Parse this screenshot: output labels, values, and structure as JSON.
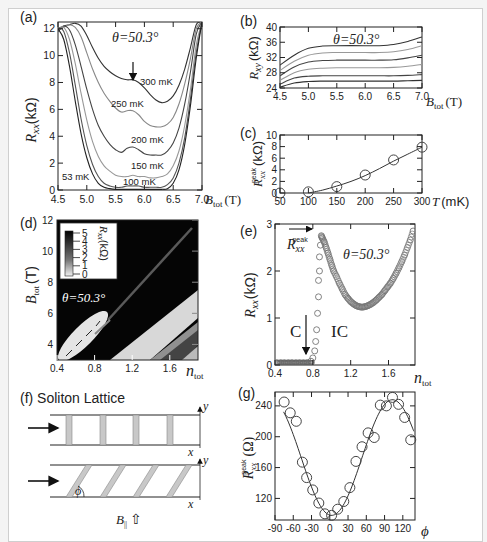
{
  "figure": {
    "panels": {
      "a": {
        "label": "(a)",
        "annotation": "θ=50.3°",
        "ylabel": "R",
        "ylabel_sub": "xx",
        "ylabel_unit": "(kΩ)",
        "xlabel": "B",
        "xlabel_sub": "tot",
        "xlabel_unit": "(T)"
      },
      "b": {
        "label": "(b)",
        "annotation": "θ=50.3°",
        "ylabel": "R",
        "ylabel_sub": "xy",
        "ylabel_unit": "(kΩ)",
        "xlabel": "B",
        "xlabel_sub": "tot",
        "xlabel_unit": "(T)"
      },
      "c": {
        "label": "(c)",
        "ylabel": "R",
        "ylabel_sub": "xx",
        "ylabel_sup": "peak",
        "ylabel_unit": "(kΩ)",
        "xlabel": "T",
        "xlabel_unit": "(mK)"
      },
      "d": {
        "label": "(d)",
        "annotation": "θ=50.3°",
        "ylabel": "B",
        "ylabel_sub": "tot",
        "ylabel_unit": "(T)",
        "xlabel": "n",
        "xlabel_sub": "tot",
        "colorbar_label": "R",
        "colorbar_sub": "xx",
        "colorbar_unit": "(kΩ)",
        "colorbar_ticks": [
          "5",
          "4",
          "3",
          "2",
          "1",
          "0"
        ]
      },
      "e": {
        "label": "(e)",
        "annotation": "θ=50.3°",
        "ylabel": "R",
        "ylabel_sub": "xx",
        "ylabel_unit": "(kΩ)",
        "xlabel": "n",
        "xlabel_sub": "tot",
        "peak_label": "R",
        "peak_sub": "xx",
        "peak_sup": "peak",
        "region_c": "C",
        "region_ic": "IC"
      },
      "f": {
        "label": "(f) Soliton Lattice",
        "axis_x": "x",
        "axis_y": "y",
        "angle": "ϕ",
        "field_label": "B",
        "field_sub": "||",
        "field_arrow": "⇧"
      },
      "g": {
        "label": "(g)",
        "ylabel": "R",
        "ylabel_sub": "xx",
        "ylabel_sup": "peak",
        "ylabel_unit": "(Ω)",
        "xlabel": "ϕ"
      }
    }
  },
  "chart_data": [
    {
      "panel": "a",
      "type": "line",
      "title": "",
      "xlabel": "B_tot (T)",
      "ylabel": "R_xx (kΩ)",
      "xlim": [
        4.5,
        7.0
      ],
      "ylim": [
        0,
        12.5
      ],
      "xticks": [
        "4.5",
        "5.0",
        "5.5",
        "6.0",
        "6.5",
        "7.0"
      ],
      "yticks": [
        "0",
        "2",
        "4",
        "6",
        "8",
        "10",
        "12"
      ],
      "annotations": [
        "θ=50.3°",
        "arrow at ~5.9 T on 300 mK curve"
      ],
      "series": [
        {
          "name": "300 mK",
          "color": "#333333",
          "x": [
            4.5,
            4.6,
            4.7,
            4.8,
            4.9,
            5.0,
            5.1,
            5.2,
            5.3,
            5.4,
            5.5,
            5.6,
            5.7,
            5.8,
            5.9,
            6.0,
            6.1,
            6.2,
            6.3,
            6.4,
            6.5,
            6.6,
            6.7,
            6.8,
            6.9,
            7.0
          ],
          "y": [
            11.8,
            12.2,
            12.3,
            12.4,
            12.2,
            11.5,
            10.6,
            9.8,
            9.2,
            8.8,
            8.5,
            8.3,
            8.2,
            8.2,
            8.0,
            7.6,
            7.1,
            6.7,
            6.5,
            6.6,
            7.0,
            7.8,
            9.0,
            10.6,
            12.3,
            12.5
          ]
        },
        {
          "name": "250 mK",
          "color": "#888888",
          "x": [
            4.5,
            4.6,
            4.7,
            4.8,
            4.9,
            5.0,
            5.1,
            5.2,
            5.3,
            5.4,
            5.5,
            5.6,
            5.7,
            5.8,
            5.9,
            6.0,
            6.1,
            6.2,
            6.3,
            6.4,
            6.5,
            6.6,
            6.7,
            6.8,
            6.9,
            7.0
          ],
          "y": [
            11.9,
            12.1,
            12.3,
            12.1,
            11.4,
            10.2,
            9.0,
            8.0,
            7.2,
            6.6,
            6.1,
            5.8,
            5.9,
            5.9,
            5.6,
            5.1,
            4.8,
            4.7,
            4.7,
            4.9,
            5.4,
            6.4,
            7.9,
            9.8,
            12.0,
            12.5
          ]
        },
        {
          "name": "200 mK",
          "color": "#444444",
          "x": [
            4.5,
            4.6,
            4.7,
            4.8,
            4.9,
            5.0,
            5.1,
            5.2,
            5.3,
            5.4,
            5.5,
            5.6,
            5.7,
            5.8,
            5.9,
            6.0,
            6.1,
            6.2,
            6.3,
            6.4,
            6.5,
            6.6,
            6.7,
            6.8,
            6.9,
            7.0
          ],
          "y": [
            11.9,
            12.2,
            11.9,
            10.8,
            9.2,
            7.5,
            6.0,
            4.8,
            4.0,
            3.4,
            3.0,
            2.8,
            3.1,
            3.2,
            3.0,
            2.7,
            2.6,
            2.6,
            2.6,
            2.9,
            3.5,
            4.6,
            6.4,
            8.8,
            11.6,
            12.5
          ]
        },
        {
          "name": "150 mK",
          "color": "#999999",
          "x": [
            4.5,
            4.6,
            4.7,
            4.8,
            4.9,
            5.0,
            5.1,
            5.2,
            5.3,
            5.4,
            5.5,
            5.6,
            5.7,
            5.8,
            5.9,
            6.0,
            6.1,
            6.2,
            6.3,
            6.4,
            6.5,
            6.6,
            6.7,
            6.8,
            6.9,
            7.0
          ],
          "y": [
            12.0,
            12.1,
            11.2,
            9.4,
            7.2,
            5.2,
            3.6,
            2.5,
            1.8,
            1.4,
            1.1,
            1.0,
            1.0,
            1.1,
            1.0,
            1.0,
            0.9,
            0.9,
            1.0,
            1.2,
            1.8,
            2.9,
            4.8,
            7.5,
            10.8,
            12.5
          ]
        },
        {
          "name": "100 mK",
          "color": "#555555",
          "x": [
            4.5,
            4.6,
            4.7,
            4.8,
            4.9,
            5.0,
            5.1,
            5.2,
            5.3,
            5.4,
            5.5,
            5.6,
            5.7,
            5.8,
            5.9,
            6.0,
            6.1,
            6.2,
            6.3,
            6.4,
            6.5,
            6.6,
            6.7,
            6.8,
            6.9,
            7.0
          ],
          "y": [
            12.1,
            11.8,
            10.2,
            7.8,
            5.3,
            3.3,
            1.9,
            1.0,
            0.5,
            0.3,
            0.2,
            0.2,
            0.3,
            0.3,
            0.3,
            0.2,
            0.2,
            0.2,
            0.2,
            0.4,
            0.9,
            2.0,
            3.9,
            6.8,
            10.2,
            12.5
          ]
        },
        {
          "name": "53 mK",
          "color": "#222222",
          "x": [
            4.5,
            4.6,
            4.7,
            4.8,
            4.9,
            5.0,
            5.1,
            5.2,
            5.3,
            5.4,
            5.5,
            5.6,
            5.7,
            5.8,
            5.9,
            6.0,
            6.1,
            6.2,
            6.3,
            6.4,
            6.5,
            6.6,
            6.7,
            6.8,
            6.9,
            7.0
          ],
          "y": [
            12.0,
            11.2,
            9.2,
            6.6,
            4.2,
            2.4,
            1.2,
            0.5,
            0.2,
            0.1,
            0.05,
            0.05,
            0.05,
            0.05,
            0.05,
            0.05,
            0.05,
            0.05,
            0.05,
            0.1,
            0.5,
            1.5,
            3.4,
            6.3,
            9.8,
            12.5
          ]
        }
      ]
    },
    {
      "panel": "b",
      "type": "line",
      "xlabel": "B_tot (T)",
      "ylabel": "R_xy (kΩ)",
      "xlim": [
        4.5,
        7.0
      ],
      "ylim": [
        24,
        40
      ],
      "xticks": [
        "4.5",
        "5.0",
        "5.5",
        "6.0",
        "6.5",
        "7.0"
      ],
      "yticks": [
        "24",
        "28",
        "32",
        "36",
        "40"
      ],
      "annotations": [
        "θ=50.3°"
      ],
      "series": [
        {
          "name": "300 mK",
          "color": "#333333",
          "x": [
            4.5,
            4.75,
            5.0,
            5.25,
            5.5,
            6.0,
            6.25,
            6.5,
            6.75,
            7.0
          ],
          "y": [
            30.0,
            32.6,
            34.4,
            35.0,
            35.1,
            35.1,
            35.1,
            35.4,
            36.2,
            37.4
          ]
        },
        {
          "name": "250 mK",
          "color": "#999999",
          "x": [
            4.5,
            4.75,
            5.0,
            5.25,
            5.5,
            6.0,
            6.25,
            6.5,
            6.75,
            7.0
          ],
          "y": [
            28.6,
            31.0,
            32.6,
            33.2,
            33.3,
            33.3,
            33.3,
            33.5,
            34.1,
            35.1
          ]
        },
        {
          "name": "200 mK",
          "color": "#444444",
          "x": [
            4.5,
            4.75,
            5.0,
            5.25,
            5.5,
            6.0,
            6.25,
            6.5,
            6.75,
            7.0
          ],
          "y": [
            27.2,
            29.5,
            30.8,
            31.2,
            31.3,
            31.3,
            31.3,
            31.4,
            31.9,
            32.6
          ]
        },
        {
          "name": "150 mK",
          "color": "#999999",
          "x": [
            4.5,
            4.75,
            5.0,
            5.25,
            5.5,
            6.0,
            6.25,
            6.5,
            6.75,
            7.0
          ],
          "y": [
            26.0,
            28.0,
            28.9,
            29.2,
            29.3,
            29.3,
            29.3,
            29.4,
            29.7,
            30.2
          ]
        },
        {
          "name": "100 mK",
          "color": "#444444",
          "x": [
            4.5,
            4.75,
            5.0,
            5.25,
            5.5,
            6.0,
            6.25,
            6.5,
            6.75,
            7.0
          ],
          "y": [
            25.0,
            26.6,
            27.1,
            27.2,
            27.2,
            27.2,
            27.2,
            27.2,
            27.3,
            27.5
          ]
        },
        {
          "name": "53 mK",
          "color": "#333333",
          "x": [
            4.5,
            4.75,
            5.0,
            5.25,
            5.5,
            6.0,
            6.25,
            6.5,
            6.75,
            7.0
          ],
          "y": [
            24.2,
            25.3,
            25.7,
            25.8,
            25.8,
            25.8,
            25.8,
            25.8,
            25.9,
            26.0
          ]
        }
      ]
    },
    {
      "panel": "c",
      "type": "scatter",
      "xlabel": "T (mK)",
      "ylabel": "R_xx^peak (kΩ)",
      "xlim": [
        50,
        300
      ],
      "ylim": [
        0,
        10
      ],
      "xticks": [
        "50",
        "100",
        "150",
        "200",
        "250",
        "300"
      ],
      "yticks": [
        "0",
        "2",
        "4",
        "6",
        "8",
        "10"
      ],
      "points": {
        "x": [
          50,
          100,
          150,
          200,
          250,
          300
        ],
        "y": [
          0.0,
          0.2,
          1.1,
          3.1,
          5.7,
          7.9
        ]
      },
      "fit": {
        "x": [
          100,
          125,
          150,
          175,
          200,
          225,
          250,
          275,
          300
        ],
        "y": [
          0.0,
          0.5,
          1.2,
          2.0,
          3.0,
          4.2,
          5.5,
          6.7,
          7.9
        ]
      }
    },
    {
      "panel": "d",
      "type": "heatmap",
      "xlabel": "n_tot",
      "ylabel": "B_tot (T)",
      "xlim": [
        0.4,
        1.9
      ],
      "ylim": [
        3,
        12
      ],
      "xticks": [
        "0.4",
        "0.8",
        "1.2",
        "1.6"
      ],
      "yticks": [
        "4",
        "6",
        "8",
        "10",
        "12"
      ],
      "colorbar": {
        "label": "R_xx (kΩ)",
        "range": [
          0,
          5
        ],
        "ticks": [
          "0",
          "1",
          "2",
          "3",
          "4",
          "5"
        ]
      },
      "annotations": [
        "θ=50.3°"
      ]
    },
    {
      "panel": "e",
      "type": "scatter",
      "xlabel": "n_tot",
      "ylabel": "R_xx (kΩ)",
      "xlim": [
        0.4,
        1.88
      ],
      "ylim": [
        0,
        3
      ],
      "xticks": [
        "0.4",
        "0.8",
        "1.2",
        "1.6"
      ],
      "yticks": [
        "0",
        "1",
        "2",
        "3"
      ],
      "annotations": [
        "θ=50.3°",
        "R_xx^peak arrow",
        "C",
        "IC"
      ],
      "points": {
        "x": [
          0.42,
          0.46,
          0.5,
          0.54,
          0.58,
          0.62,
          0.66,
          0.7,
          0.74,
          0.78,
          0.8,
          0.82,
          0.83,
          0.84,
          0.85,
          0.86,
          0.86,
          0.87,
          0.87,
          0.88,
          0.89,
          0.9,
          0.92,
          0.94,
          0.96,
          0.98,
          1.0,
          1.02,
          1.05,
          1.08,
          1.11,
          1.14,
          1.17,
          1.2,
          1.23,
          1.26,
          1.29,
          1.32,
          1.35,
          1.38,
          1.41,
          1.44,
          1.47,
          1.5,
          1.53,
          1.56,
          1.59,
          1.62,
          1.65,
          1.68,
          1.71,
          1.74,
          1.77,
          1.8,
          1.83,
          1.86
        ],
        "y": [
          0.05,
          0.05,
          0.05,
          0.05,
          0.05,
          0.05,
          0.05,
          0.05,
          0.05,
          0.08,
          0.15,
          0.3,
          0.5,
          0.75,
          1.1,
          1.45,
          1.8,
          2.0,
          2.3,
          2.55,
          2.75,
          2.7,
          2.62,
          2.5,
          2.38,
          2.25,
          2.12,
          2.0,
          1.88,
          1.74,
          1.62,
          1.5,
          1.42,
          1.35,
          1.3,
          1.26,
          1.24,
          1.23,
          1.24,
          1.26,
          1.29,
          1.33,
          1.38,
          1.44,
          1.5,
          1.58,
          1.66,
          1.74,
          1.84,
          1.95,
          2.07,
          2.2,
          2.34,
          2.5,
          2.66,
          2.85
        ]
      }
    },
    {
      "panel": "g",
      "type": "scatter",
      "xlabel": "ϕ",
      "ylabel": "R_xx^peak (Ω)",
      "xlim": [
        -90,
        140
      ],
      "ylim": [
        92,
        258
      ],
      "xticks": [
        "-90",
        "-60",
        "-30",
        "0",
        "30",
        "60",
        "90",
        "120"
      ],
      "yticks": [
        "120",
        "160",
        "200",
        "240"
      ],
      "points": {
        "x": [
          -75,
          -65,
          -55,
          -45,
          -38,
          -28,
          -18,
          -8,
          3,
          13,
          23,
          33,
          43,
          53,
          63,
          73,
          83,
          93,
          103,
          113,
          123,
          133
        ],
        "y": [
          245,
          231,
          220,
          167,
          147,
          131,
          114,
          100,
          98,
          106,
          116,
          134,
          168,
          187,
          205,
          199,
          241,
          240,
          251,
          242,
          225,
          196
        ]
      },
      "fit": {
        "type": "cosine",
        "min_x": 3,
        "min_y": 98,
        "max_y": 248
      }
    }
  ]
}
